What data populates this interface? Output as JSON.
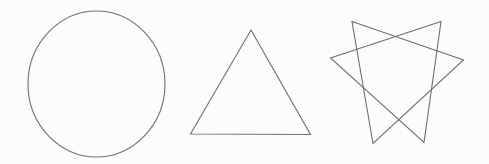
{
  "canvas": {
    "width": 489,
    "height": 164,
    "background_color": "#fcfcfc",
    "stroke_color": "#6f6f6f",
    "stroke_width": 1.1,
    "fill": "none"
  },
  "figure": {
    "caption": "",
    "shape_count": 3
  },
  "shapes": [
    {
      "id": "circle",
      "label": "circle",
      "type": "ellipse",
      "center_x": 96.5,
      "center_y": 84,
      "radius_x": 68.5,
      "radius_y": 73,
      "bounds": {
        "left": 28,
        "top": 11,
        "right": 165,
        "bottom": 157
      },
      "path": "M 96.5 11 C 133 11 165 43 165 84 C 165 125 133 157 96.5 157 C 60 157 28 125 28 84 C 28 43 60 11 96.5 11 Z"
    },
    {
      "id": "triangle",
      "label": "triangle",
      "type": "polygon",
      "sides": 3,
      "bounds": {
        "left": 190,
        "top": 30,
        "right": 311,
        "bottom": 135
      },
      "points": [
        {
          "x": 251,
          "y": 30
        },
        {
          "x": 310.5,
          "y": 134.5
        },
        {
          "x": 190.5,
          "y": 134
        }
      ],
      "path": "M 251 30 L 310.5 134.5 L 190.5 134 Z"
    },
    {
      "id": "star-two-triangles",
      "label": "two overlapping triangles",
      "type": "compound-polygon",
      "sides": 6,
      "bounds": {
        "left": 330,
        "top": 21,
        "right": 464,
        "bottom": 144
      },
      "sub_shapes": [
        {
          "id": "triangle-a",
          "label": "left-leaning triangle",
          "points": [
            {
              "x": 352,
              "y": 21.5
            },
            {
              "x": 463.5,
              "y": 60
            },
            {
              "x": 373,
              "y": 143.5
            }
          ],
          "path": "M 352 21.5 L 463.5 60 L 373 143.5 Z"
        },
        {
          "id": "triangle-b",
          "label": "right-leaning triangle",
          "points": [
            {
              "x": 441,
              "y": 21.5
            },
            {
              "x": 330.5,
              "y": 58
            },
            {
              "x": 424,
              "y": 142.5
            }
          ],
          "path": "M 441 21.5 L 330.5 58 L 424 142.5 Z"
        }
      ]
    }
  ]
}
